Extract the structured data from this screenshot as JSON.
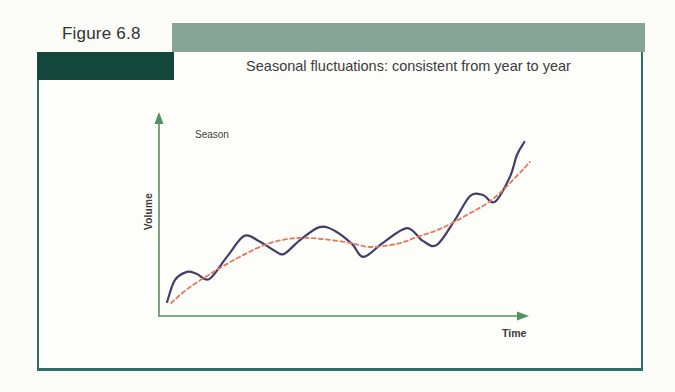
{
  "figure": {
    "label": "Figure 6.8",
    "title": "Seasonal fluctuations: consistent from year to year"
  },
  "chart": {
    "annotation": "Season",
    "y_label": "Volume",
    "x_label": "Time"
  },
  "colors": {
    "accent_bar": "#87A597",
    "dark_bar": "#14473C",
    "panel_border": "#2F6F65",
    "axis": "#55915F",
    "seasonal_line": "#423E68",
    "trend_line": "#E5795D",
    "text": "#3A3A3A"
  },
  "chart_data": {
    "type": "line",
    "title": "Seasonal fluctuations: consistent from year to year",
    "xlabel": "Time",
    "ylabel": "Volume",
    "axes_numeric": false,
    "x_range": [
      0,
      100
    ],
    "y_range": [
      0,
      100
    ],
    "grid": false,
    "legend": "none",
    "annotations": [
      {
        "text": "Season",
        "x": 10,
        "y": 90
      }
    ],
    "series": [
      {
        "name": "seasonal-volume",
        "style": "solid",
        "color": "#423E68",
        "width": 2.2,
        "points": [
          [
            2.2,
            6.9
          ],
          [
            4.3,
            17.7
          ],
          [
            7.6,
            21.7
          ],
          [
            10.3,
            20.7
          ],
          [
            13.6,
            18.2
          ],
          [
            18.4,
            29.1
          ],
          [
            23.0,
            39.4
          ],
          [
            27.0,
            37.0
          ],
          [
            31.0,
            32.5
          ],
          [
            33.8,
            30.5
          ],
          [
            38.2,
            37.4
          ],
          [
            43.5,
            43.8
          ],
          [
            47.7,
            41.9
          ],
          [
            52.3,
            35.5
          ],
          [
            55.4,
            29.1
          ],
          [
            60.7,
            36.0
          ],
          [
            67.2,
            43.3
          ],
          [
            71.5,
            37.0
          ],
          [
            75.3,
            35.0
          ],
          [
            80.2,
            47.3
          ],
          [
            84.3,
            59.1
          ],
          [
            87.8,
            59.6
          ],
          [
            91.0,
            56.2
          ],
          [
            95.1,
            68.5
          ],
          [
            97.0,
            79.3
          ],
          [
            99.0,
            85.7
          ]
        ]
      },
      {
        "name": "trend",
        "style": "dashed",
        "color": "#E5795D",
        "width": 1.8,
        "points": [
          [
            3.3,
            6.4
          ],
          [
            8.4,
            14.3
          ],
          [
            15.7,
            22.7
          ],
          [
            22.8,
            30.0
          ],
          [
            30.1,
            36.0
          ],
          [
            37.4,
            38.4
          ],
          [
            44.4,
            37.9
          ],
          [
            51.8,
            36.0
          ],
          [
            57.2,
            34.0
          ],
          [
            64.5,
            35.5
          ],
          [
            69.9,
            38.9
          ],
          [
            76.2,
            42.9
          ],
          [
            83.5,
            49.8
          ],
          [
            90.5,
            57.6
          ],
          [
            97.0,
            69.0
          ],
          [
            100.5,
            75.9
          ]
        ]
      }
    ]
  }
}
